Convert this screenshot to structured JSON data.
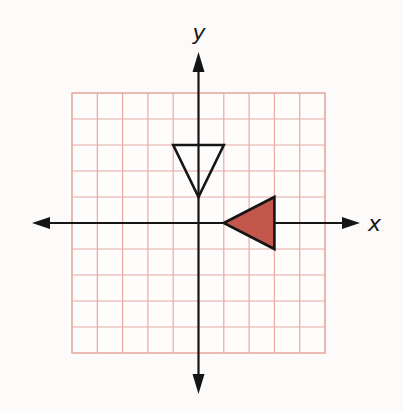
{
  "diagram": {
    "title": "",
    "grid": {
      "x_range": [
        -5,
        5
      ],
      "y_range": [
        -5,
        5
      ],
      "step": 1,
      "line_color": "#e8a9a2",
      "background": "#fffdfc"
    },
    "axes": {
      "x_label": "x",
      "y_label": "y",
      "color": "#151515",
      "arrows": "both-ends"
    },
    "shapes": [
      {
        "name": "open-triangle",
        "type": "triangle",
        "vertices": [
          [
            -1,
            3
          ],
          [
            1,
            3
          ],
          [
            0,
            1
          ]
        ],
        "fill": "none",
        "stroke": "#151515"
      },
      {
        "name": "filled-triangle",
        "type": "triangle",
        "vertices": [
          [
            1,
            0
          ],
          [
            3,
            1
          ],
          [
            3,
            -1
          ]
        ],
        "fill": "#c4574b",
        "stroke": "#151515"
      }
    ]
  }
}
